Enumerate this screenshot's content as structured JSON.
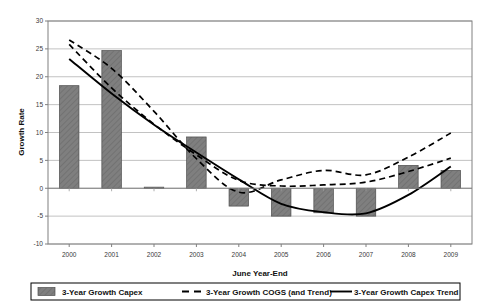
{
  "chart_data": {
    "type": "bar",
    "title": "",
    "xlabel": "June Year-End",
    "ylabel": "Growth Rate",
    "categories": [
      "2000",
      "2001",
      "2002",
      "2003",
      "2004",
      "2005",
      "2006",
      "2007",
      "2008",
      "2009"
    ],
    "ylim": [
      -10,
      30
    ],
    "yticks": [
      -10,
      -5,
      0,
      5,
      10,
      15,
      20,
      25,
      30
    ],
    "ytick_labels": [
      "-10",
      "-5",
      "0",
      "5",
      "10",
      "15",
      "20",
      "25",
      "30"
    ],
    "grid": true,
    "legend_position": "bottom",
    "series": [
      {
        "name": "3-Year Growth Capex",
        "type": "bar",
        "style": "hatched-gray",
        "color": "#7f7f7f",
        "values": [
          18.4,
          24.7,
          0.2,
          9.2,
          -3.2,
          -5.0,
          -4.4,
          -5.0,
          4.1,
          3.2
        ]
      },
      {
        "name": "3-Year Growth COGS (and Trend)",
        "type": "line",
        "style": "dashed",
        "color": "#000000",
        "values": [
          26.6,
          21.5,
          13.8,
          5.3,
          -0.7,
          1.5,
          3.2,
          2.4,
          5.6,
          9.9
        ]
      },
      {
        "name": "3-Year Growth COGS Trend",
        "type": "line",
        "style": "dashed",
        "color": "#000000",
        "values": [
          25.8,
          18.0,
          11.5,
          6.0,
          1.4,
          0.4,
          0.6,
          1.1,
          3.0,
          5.4
        ]
      },
      {
        "name": "3-Year Growth Capex Trend",
        "type": "line",
        "style": "solid",
        "color": "#000000",
        "values": [
          23.2,
          17.0,
          11.4,
          6.4,
          1.6,
          -2.8,
          -4.3,
          -4.5,
          -1.2,
          3.9
        ]
      }
    ]
  },
  "legend": {
    "items": [
      {
        "label": "3-Year Growth Capex",
        "marker": "swatch-hatched"
      },
      {
        "label": "3-Year Growth COGS (and Trend)",
        "marker": "dashed-line"
      },
      {
        "label": "3-Year Growth Capex Trend",
        "marker": "solid-line"
      }
    ]
  },
  "colors": {
    "bar_fill": "#7f7f7f",
    "bar_edge": "#4d4d4d",
    "grid": "#b3b3b3",
    "axis": "#808080",
    "line": "#000000"
  }
}
